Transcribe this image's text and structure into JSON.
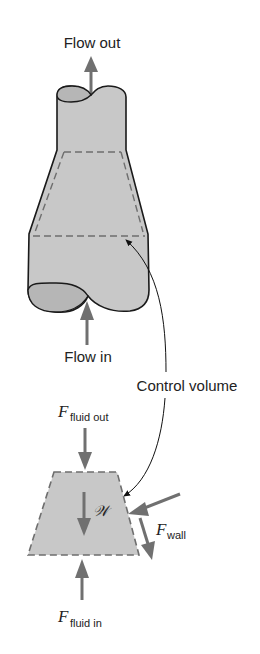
{
  "figure": {
    "labels": {
      "flow_out": "Flow out",
      "flow_in": "Flow in",
      "control_volume": "Control volume",
      "f_fluid_out_symbol": "F",
      "f_fluid_out_subscript": "fluid out",
      "f_fluid_in_symbol": "F",
      "f_fluid_in_subscript": "fluid in",
      "f_wall_symbol": "F",
      "f_wall_subscript": "wall",
      "weight_symbol": "𝒲"
    },
    "colors": {
      "fluid_fill": "#c8c8c8",
      "outline": "#1a1a1a",
      "arrow": "#707070",
      "dash": "#6e6e6e",
      "text": "#222222"
    }
  }
}
